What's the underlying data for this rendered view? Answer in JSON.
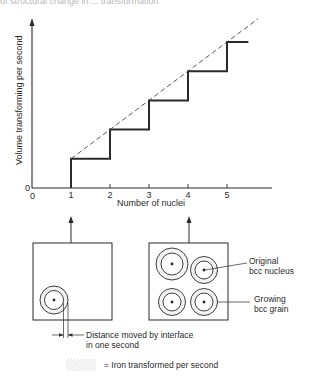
{
  "header_fragment": "of structural change in ... transformation",
  "chart_data": {
    "type": "line",
    "title": "",
    "xlabel": "Number of nuclei",
    "ylabel": "Volume transforming per second",
    "x_ticks": [
      "1",
      "2",
      "3",
      "4",
      "5"
    ],
    "origin_labels": {
      "x": "0",
      "y": "0"
    },
    "xlim": [
      0,
      6.2
    ],
    "ylim": [
      0,
      6.2
    ],
    "series": [
      {
        "name": "stepwise volume",
        "style": "solid-step",
        "points": [
          [
            1,
            0
          ],
          [
            1,
            1
          ],
          [
            2,
            1
          ],
          [
            2,
            2
          ],
          [
            3,
            2
          ],
          [
            3,
            3
          ],
          [
            4,
            3
          ],
          [
            4,
            4
          ],
          [
            5,
            4
          ],
          [
            5,
            5
          ],
          [
            5.55,
            5
          ]
        ]
      },
      {
        "name": "proportional trend",
        "style": "dashed",
        "points": [
          [
            1,
            1
          ],
          [
            5.8,
            5.8
          ]
        ]
      }
    ],
    "grid": false,
    "legend": "none"
  },
  "panels": {
    "left": {
      "nuclei": 1,
      "arrow_from_x": 1
    },
    "right": {
      "nuclei": 4,
      "arrow_from_x": 4
    }
  },
  "annotations": {
    "distance_line1": "Distance moved by interface",
    "distance_line2": "in one second",
    "original_line1": "Original",
    "original_line2": "bcc nucleus",
    "growing_line1": "Growing",
    "growing_line2": "bcc grain",
    "legend_text": "= Iron transformed per second"
  },
  "colors": {
    "ink": "#2a2a2a",
    "stipple": "#8a8a8a"
  }
}
